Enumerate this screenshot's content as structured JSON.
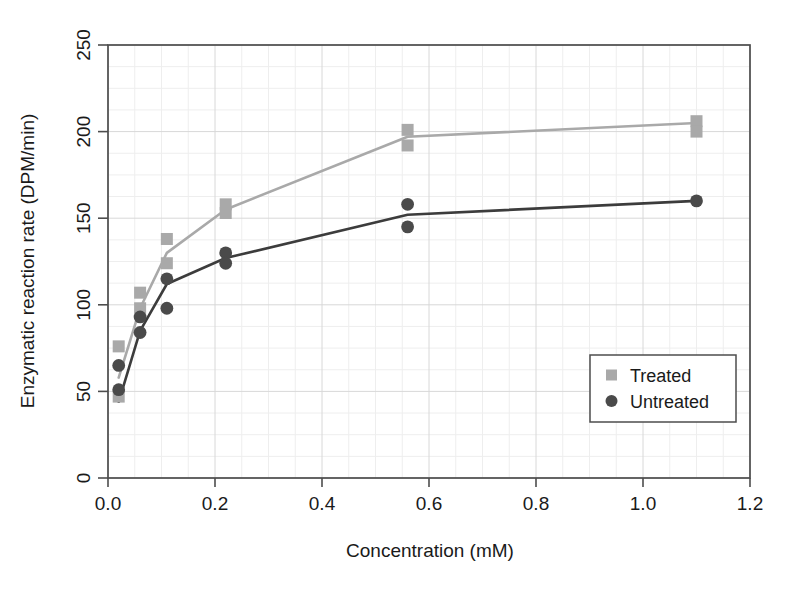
{
  "chart_data": {
    "type": "scatter",
    "title": "",
    "xlabel": "Concentration (mM)",
    "ylabel": "Enzymatic reaction rate (DPM/min)",
    "xlim": [
      0.0,
      1.2
    ],
    "ylim": [
      0,
      250
    ],
    "xticks": [
      "0.0",
      "0.2",
      "0.4",
      "0.6",
      "0.8",
      "1.0",
      "1.2"
    ],
    "xtick_values": [
      0.0,
      0.2,
      0.4,
      0.6,
      0.8,
      1.0,
      1.2
    ],
    "yticks": [
      "0",
      "50",
      "100",
      "150",
      "200",
      "250"
    ],
    "ytick_values": [
      0,
      50,
      100,
      150,
      200,
      250
    ],
    "grid": true,
    "grid_minor": true,
    "legend_position": "lower right",
    "series": [
      {
        "name": "Treated",
        "marker": "square",
        "color": "#a9a9a9",
        "line_color": "#a9a9a9",
        "points": [
          {
            "x": 0.02,
            "y": 76
          },
          {
            "x": 0.02,
            "y": 47
          },
          {
            "x": 0.06,
            "y": 107
          },
          {
            "x": 0.06,
            "y": 98
          },
          {
            "x": 0.11,
            "y": 138
          },
          {
            "x": 0.11,
            "y": 124
          },
          {
            "x": 0.22,
            "y": 158
          },
          {
            "x": 0.22,
            "y": 153
          },
          {
            "x": 0.56,
            "y": 201
          },
          {
            "x": 0.56,
            "y": 192
          },
          {
            "x": 1.1,
            "y": 206
          },
          {
            "x": 1.1,
            "y": 200
          }
        ],
        "fit_line": [
          {
            "x": 0.02,
            "y": 58
          },
          {
            "x": 0.06,
            "y": 98
          },
          {
            "x": 0.11,
            "y": 130
          },
          {
            "x": 0.22,
            "y": 155
          },
          {
            "x": 0.56,
            "y": 197
          },
          {
            "x": 1.1,
            "y": 205
          }
        ]
      },
      {
        "name": "Untreated",
        "marker": "circle",
        "color": "#4a4a4a",
        "line_color": "#3c3c3c",
        "points": [
          {
            "x": 0.02,
            "y": 65
          },
          {
            "x": 0.02,
            "y": 51
          },
          {
            "x": 0.06,
            "y": 93
          },
          {
            "x": 0.06,
            "y": 84
          },
          {
            "x": 0.11,
            "y": 115
          },
          {
            "x": 0.11,
            "y": 98
          },
          {
            "x": 0.22,
            "y": 130
          },
          {
            "x": 0.22,
            "y": 124
          },
          {
            "x": 0.56,
            "y": 158
          },
          {
            "x": 0.56,
            "y": 145
          },
          {
            "x": 1.1,
            "y": 160
          }
        ],
        "fit_line": [
          {
            "x": 0.02,
            "y": 44
          },
          {
            "x": 0.06,
            "y": 85
          },
          {
            "x": 0.11,
            "y": 112
          },
          {
            "x": 0.22,
            "y": 127
          },
          {
            "x": 0.56,
            "y": 152
          },
          {
            "x": 1.1,
            "y": 160
          }
        ]
      }
    ]
  },
  "legend": {
    "entries": [
      {
        "label": "Treated",
        "marker": "square",
        "color": "#a9a9a9"
      },
      {
        "label": "Untreated",
        "marker": "circle",
        "color": "#4a4a4a"
      }
    ]
  },
  "colors": {
    "treated": "#a9a9a9",
    "untreated": "#4a4a4a",
    "axis": "#4d4d4d",
    "grid_major": "#d8d8d8",
    "grid_minor": "#eeeeee",
    "background": "#ffffff",
    "text": "#1a1a1a"
  }
}
